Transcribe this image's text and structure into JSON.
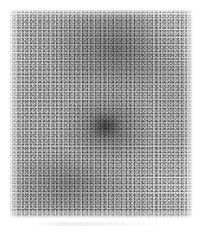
{
  "page": {
    "width": 204,
    "height": 233,
    "background_color": "#ffffff",
    "caption": "",
    "title": ""
  },
  "image_plate": {
    "name": "grayscale-grain-texture",
    "description": "Scanned grayscale grain / speckle texture field with no text or graphic overlay",
    "bounds": {
      "left": 9,
      "top": 9,
      "width": 184,
      "height": 209
    },
    "is_monochrome": true,
    "tones": {
      "lightest": "#f2f2f2",
      "base": "#cfcfcf",
      "midtone": "#a8a8a8",
      "darkest": "#3c3c3c"
    },
    "regions": [
      {
        "name": "upper-centre-dark-patch",
        "position": "57% 21%",
        "tone": "dark"
      },
      {
        "name": "centre-dark-nucleus",
        "position": "53% 56%",
        "tone": "darkest"
      },
      {
        "name": "lower-left-dark-band",
        "position": "34% 82%",
        "tone": "dark"
      },
      {
        "name": "upper-right-light-field",
        "position": "84% 12%",
        "tone": "light"
      },
      {
        "name": "lower-right-light-field",
        "position": "88% 83%",
        "tone": "light"
      },
      {
        "name": "left-edge-light-fade",
        "position": "2% 50%",
        "tone": "lightest"
      }
    ]
  },
  "artifacts": {
    "bottom_smudge": {
      "name": "scanner-smudge",
      "bounds": {
        "left": 34,
        "top": 222,
        "width": 128,
        "height": 4
      },
      "tone": "#969696"
    }
  }
}
